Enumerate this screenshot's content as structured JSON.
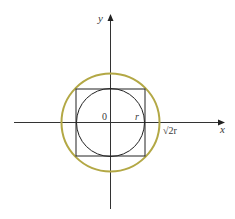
{
  "diagram": {
    "axes": {
      "x_label": "x",
      "y_label": "y",
      "origin_label": "0"
    },
    "labels": {
      "inner_radius": "r",
      "outer_radius": "√2r"
    },
    "shapes": {
      "inner_circle": {
        "radius_label": "r",
        "color": "#222222"
      },
      "square": {
        "half_side_label": "r",
        "color": "#222222"
      },
      "outer_circle": {
        "radius_label": "√2r",
        "color": "#b3a845"
      }
    },
    "colors": {
      "axis": "#222222",
      "outer_circle": "#b3a845",
      "text": "#3a3a3a"
    }
  }
}
